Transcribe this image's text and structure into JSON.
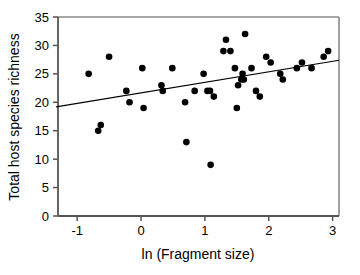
{
  "chart_data": {
    "type": "scatter",
    "title": "",
    "xlabel": "ln (Fragment size)",
    "ylabel": "Total host species richness",
    "xlim": [
      -1.3,
      3.1
    ],
    "ylim": [
      0,
      35
    ],
    "xticks": [
      -1,
      0,
      1,
      2,
      3
    ],
    "xticklabels": [
      "-1",
      "0",
      "1",
      "2",
      "3"
    ],
    "yticks": [
      0,
      5,
      10,
      15,
      20,
      25,
      30,
      35
    ],
    "yticklabels": [
      "0",
      "5",
      "10",
      "15",
      "20",
      "25",
      "30",
      "35"
    ],
    "grid": false,
    "legend": null,
    "marker": "filled-circle",
    "marker_color": "#000000",
    "points": [
      {
        "x": -0.82,
        "y": 25
      },
      {
        "x": -0.67,
        "y": 15
      },
      {
        "x": -0.63,
        "y": 16
      },
      {
        "x": -0.5,
        "y": 28
      },
      {
        "x": -0.23,
        "y": 22
      },
      {
        "x": -0.18,
        "y": 20
      },
      {
        "x": 0.02,
        "y": 26
      },
      {
        "x": 0.04,
        "y": 19
      },
      {
        "x": 0.32,
        "y": 23
      },
      {
        "x": 0.34,
        "y": 22
      },
      {
        "x": 0.49,
        "y": 26
      },
      {
        "x": 0.69,
        "y": 20
      },
      {
        "x": 0.71,
        "y": 13
      },
      {
        "x": 0.84,
        "y": 22
      },
      {
        "x": 0.98,
        "y": 25
      },
      {
        "x": 1.04,
        "y": 22
      },
      {
        "x": 1.08,
        "y": 22
      },
      {
        "x": 1.09,
        "y": 9
      },
      {
        "x": 1.14,
        "y": 21
      },
      {
        "x": 1.29,
        "y": 29
      },
      {
        "x": 1.33,
        "y": 31
      },
      {
        "x": 1.4,
        "y": 29
      },
      {
        "x": 1.47,
        "y": 26
      },
      {
        "x": 1.5,
        "y": 19
      },
      {
        "x": 1.52,
        "y": 23
      },
      {
        "x": 1.57,
        "y": 24
      },
      {
        "x": 1.59,
        "y": 25
      },
      {
        "x": 1.61,
        "y": 24
      },
      {
        "x": 1.63,
        "y": 32
      },
      {
        "x": 1.73,
        "y": 26
      },
      {
        "x": 1.8,
        "y": 22
      },
      {
        "x": 1.86,
        "y": 21
      },
      {
        "x": 1.96,
        "y": 28
      },
      {
        "x": 2.03,
        "y": 27
      },
      {
        "x": 2.18,
        "y": 25
      },
      {
        "x": 2.22,
        "y": 24
      },
      {
        "x": 2.44,
        "y": 26
      },
      {
        "x": 2.52,
        "y": 27
      },
      {
        "x": 2.67,
        "y": 26
      },
      {
        "x": 2.86,
        "y": 28
      },
      {
        "x": 2.93,
        "y": 29
      }
    ],
    "trendline": {
      "type": "linear",
      "x_start": -1.33,
      "y_start": 19.2,
      "x_end": 3.1,
      "y_end": 27.4,
      "color": "#000000"
    }
  }
}
